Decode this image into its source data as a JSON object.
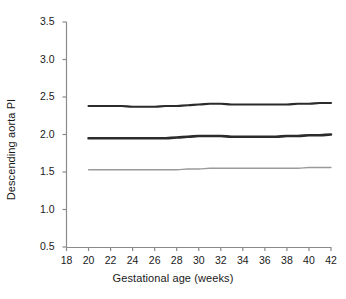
{
  "chart_data": {
    "type": "line",
    "title": "",
    "xlabel": "Gestational age (weeks)",
    "ylabel": "Descending aorta PI",
    "xlim": [
      18,
      42
    ],
    "ylim": [
      0.5,
      3.5
    ],
    "xticks": [
      18,
      20,
      22,
      24,
      26,
      28,
      30,
      32,
      34,
      36,
      38,
      40,
      42
    ],
    "yticks": [
      "0.5",
      "1.0",
      "1.5",
      "2.0",
      "2.5",
      "3.0",
      "3.5"
    ],
    "grid": false,
    "legend": "none",
    "x": [
      20,
      21,
      22,
      23,
      24,
      25,
      26,
      27,
      28,
      29,
      30,
      31,
      32,
      33,
      34,
      35,
      36,
      37,
      38,
      39,
      40,
      41,
      42
    ],
    "series": [
      {
        "name": "upper centile",
        "color": "#2b2b2b",
        "width": 2.2,
        "values": [
          2.38,
          2.38,
          2.38,
          2.38,
          2.37,
          2.37,
          2.37,
          2.38,
          2.38,
          2.39,
          2.4,
          2.41,
          2.41,
          2.4,
          2.4,
          2.4,
          2.4,
          2.4,
          2.4,
          2.41,
          2.41,
          2.42,
          2.42
        ]
      },
      {
        "name": "median centile",
        "color": "#2b2b2b",
        "width": 2.6,
        "values": [
          1.95,
          1.95,
          1.95,
          1.95,
          1.95,
          1.95,
          1.95,
          1.95,
          1.96,
          1.97,
          1.98,
          1.98,
          1.98,
          1.97,
          1.97,
          1.97,
          1.97,
          1.97,
          1.98,
          1.98,
          1.99,
          1.99,
          2.0
        ]
      },
      {
        "name": "lower centile",
        "color": "#9a9a9a",
        "width": 1.3,
        "values": [
          1.53,
          1.53,
          1.53,
          1.53,
          1.53,
          1.53,
          1.53,
          1.53,
          1.53,
          1.54,
          1.54,
          1.55,
          1.55,
          1.55,
          1.55,
          1.55,
          1.55,
          1.55,
          1.55,
          1.55,
          1.56,
          1.56,
          1.56
        ]
      }
    ]
  },
  "axes": {
    "axis_color": "#8a8a8a",
    "text_color": "#1a1a1a"
  }
}
